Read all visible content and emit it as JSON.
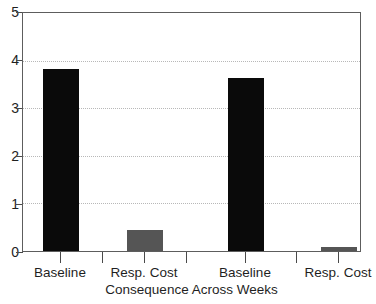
{
  "chart_data": {
    "type": "bar",
    "title": "",
    "subtitle": "",
    "xlabel": "Consequence Across Weeks",
    "ylabel": "",
    "categories": [
      "Baseline",
      "Resp. Cost",
      "Baseline",
      "Resp. Cost"
    ],
    "values": [
      3.83,
      0.45,
      3.63,
      0.08
    ],
    "bar_colors": [
      "#0a0a0a",
      "#555555",
      "#0a0a0a",
      "#555555"
    ],
    "ylim": [
      0,
      5
    ],
    "ytick_labels": [
      "0",
      "1",
      "2",
      "3",
      "4",
      "5"
    ],
    "ytick_values": [
      0,
      1,
      2,
      3,
      4,
      5
    ],
    "gridlines_at": [
      1,
      2,
      3,
      4
    ],
    "grid": true,
    "grid_style": "dotted",
    "legend": null,
    "legend_position": "none",
    "annotations": [],
    "series": [
      {
        "name": "Consequence",
        "values": [
          3.83,
          0.45,
          3.63,
          0.08
        ]
      }
    ]
  },
  "axes": {
    "y_tick_labels": [
      {
        "text": "5",
        "value": 5
      },
      {
        "text": "4",
        "value": 4
      },
      {
        "text": "3",
        "value": 3
      },
      {
        "text": "2",
        "value": 2
      },
      {
        "text": "1",
        "value": 1
      },
      {
        "text": "0",
        "value": 0
      }
    ],
    "x_tick_labels": [
      {
        "text": "Baseline"
      },
      {
        "text": "Resp. Cost"
      },
      {
        "text": "Baseline"
      },
      {
        "text": "Resp. Cost"
      }
    ],
    "x_axis_title": "Consequence Across Weeks"
  },
  "style": {
    "bar_dark": "#0a0a0a",
    "bar_light": "#555555",
    "frame": "#5d5d5d",
    "grid": "#b8b8b8",
    "text": "#1f1f1f",
    "background": "#ffffff"
  }
}
